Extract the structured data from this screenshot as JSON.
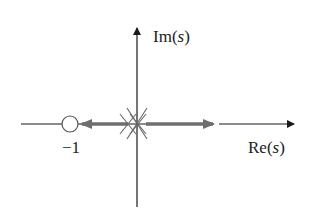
{
  "labels": {
    "im_axis": "Im",
    "re_axis": "Re",
    "variable": "s",
    "paren_open": "(",
    "paren_close": ")",
    "zero_label": "−1"
  },
  "diagram": {
    "type": "root-locus",
    "poles": [
      {
        "re": 0,
        "im": 0,
        "marker": "x"
      },
      {
        "re": 0,
        "im": 0,
        "marker": "x"
      },
      {
        "re": 0,
        "im": 0,
        "marker": "x"
      }
    ],
    "zeros": [
      {
        "re": -1,
        "im": 0,
        "marker": "o"
      }
    ],
    "locus_branches": [
      {
        "from": "origin",
        "direction": "left",
        "toward": "-1"
      },
      {
        "from": "origin",
        "direction": "right",
        "toward": "+infinity"
      }
    ],
    "colors": {
      "axis": "#1a1a1a",
      "locus": "#6e6e6e",
      "markers": "#555555"
    }
  }
}
